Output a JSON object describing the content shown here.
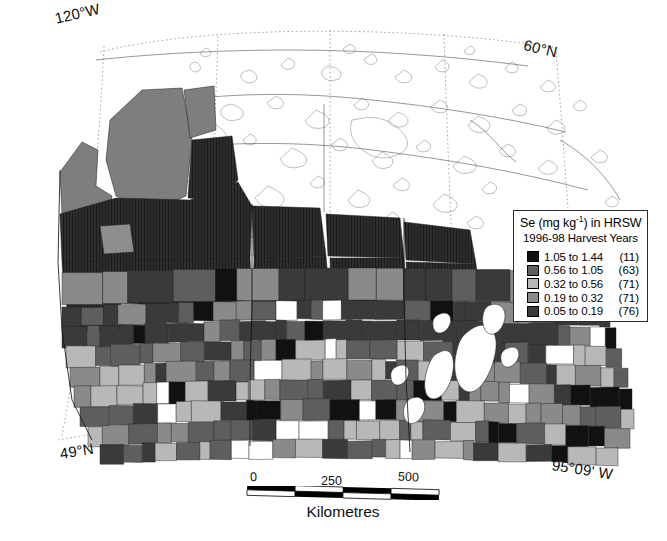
{
  "figure": {
    "kind": "choropleth-map",
    "region": "Canadian Prairie Provinces",
    "background_color": "#ffffff"
  },
  "graticule_labels": {
    "top_left": "120°W",
    "top_right": "60°N",
    "bottom_left": "49°N",
    "bottom_right": "95°09' W"
  },
  "legend": {
    "title_main": "Se (mg kg",
    "title_sup": "-1",
    "title_tail": ") in HRSW",
    "subtitle": "1996-98 Harvest Years",
    "classes": [
      {
        "range": "1.05 to 1.44",
        "count": "(11)",
        "color": "#111111"
      },
      {
        "range": "0.56 to 1.05",
        "count": "(63)",
        "color": "#5e5e5e"
      },
      {
        "range": "0.32 to 0.56",
        "count": "(71)",
        "color": "#b8b8b8"
      },
      {
        "range": "0.19 to 0.32",
        "count": "(71)",
        "color": "#8a8a8a"
      },
      {
        "range": "0.05 to 0.19",
        "count": "(76)",
        "color": "#3a3a3a"
      }
    ]
  },
  "scale_bar": {
    "ticks": [
      "0",
      "250",
      "500"
    ],
    "units_label": "Kilometres",
    "min_km": 0,
    "max_km": 500
  },
  "chart_data": {
    "type": "choropleth",
    "value_label": "Se (mg kg-1)",
    "legend_position": "right-upper",
    "classes": [
      {
        "label": "1.05 to 1.44",
        "min": 1.05,
        "max": 1.44,
        "count": 11,
        "color": "#111111"
      },
      {
        "label": "0.56 to 1.05",
        "min": 0.56,
        "max": 1.05,
        "count": 63,
        "color": "#5e5e5e"
      },
      {
        "label": "0.32 to 0.56",
        "min": 0.32,
        "max": 0.56,
        "count": 71,
        "color": "#b8b8b8"
      },
      {
        "label": "0.19 to 0.32",
        "min": 0.19,
        "max": 0.32,
        "count": 71,
        "color": "#8a8a8a"
      },
      {
        "label": "0.05 to 0.19",
        "min": 0.05,
        "max": 0.19,
        "count": 76,
        "color": "#3a3a3a"
      }
    ],
    "total_units": 292,
    "extent": {
      "west": "120°W",
      "north": "60°N",
      "south": "49°N",
      "east": "95°09' W"
    },
    "scale_km": [
      0,
      250,
      500
    ]
  }
}
